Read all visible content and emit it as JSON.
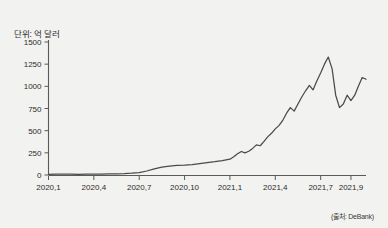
{
  "figure": {
    "unit_label": "단위: 억 달러",
    "source_label": "(출처: DeBank)",
    "background_color": "#f2f2f0",
    "line_color": "#4a4a4a",
    "axis_color": "#5a5a5a"
  },
  "chart_data": {
    "type": "line",
    "title": "",
    "subtitle": "",
    "xlabel": "",
    "ylabel": "단위: 억 달러",
    "ylim": [
      0,
      1500
    ],
    "yticks": [
      0,
      250,
      500,
      750,
      1000,
      1250,
      1500
    ],
    "ytick_labels": [
      "0",
      "250",
      "500",
      "750",
      "1000",
      "1250",
      "1500"
    ],
    "xtick_labels": [
      "2020,1",
      "2020,4",
      "2020,7",
      "2020,10",
      "2021,1",
      "2021,4",
      "2021,7",
      "2021,9"
    ],
    "xtick_values": [
      2020.0,
      2020.25,
      2020.5,
      2020.75,
      2021.0,
      2021.25,
      2021.5,
      2021.667
    ],
    "xlim": [
      2020.0,
      2021.75
    ],
    "grid": false,
    "legend": false,
    "annotations": [
      "(출처: DeBank)"
    ],
    "series": [
      {
        "name": "DeFi 예치금 (TVL)",
        "color": "#4a4a4a",
        "x": [
          2020.0,
          2020.042,
          2020.083,
          2020.125,
          2020.167,
          2020.208,
          2020.25,
          2020.292,
          2020.333,
          2020.375,
          2020.417,
          2020.458,
          2020.5,
          2020.542,
          2020.583,
          2020.625,
          2020.667,
          2020.708,
          2020.75,
          2020.792,
          2020.833,
          2020.875,
          2020.917,
          2020.958,
          2021.0,
          2021.021,
          2021.042,
          2021.063,
          2021.083,
          2021.104,
          2021.125,
          2021.146,
          2021.167,
          2021.188,
          2021.208,
          2021.229,
          2021.25,
          2021.271,
          2021.292,
          2021.313,
          2021.333,
          2021.354,
          2021.375,
          2021.396,
          2021.417,
          2021.438,
          2021.458,
          2021.479,
          2021.5,
          2021.521,
          2021.542,
          2021.563,
          2021.583,
          2021.604,
          2021.625,
          2021.646,
          2021.667,
          2021.688,
          2021.708,
          2021.729,
          2021.75
        ],
        "values": [
          8,
          9,
          10,
          9,
          8,
          9,
          10,
          11,
          12,
          14,
          16,
          20,
          26,
          45,
          70,
          90,
          100,
          108,
          112,
          118,
          128,
          140,
          150,
          162,
          178,
          205,
          240,
          265,
          250,
          268,
          300,
          340,
          330,
          380,
          430,
          470,
          520,
          560,
          620,
          700,
          760,
          720,
          800,
          880,
          950,
          1010,
          960,
          1060,
          1150,
          1250,
          1330,
          1200,
          900,
          760,
          800,
          900,
          840,
          900,
          1000,
          1100,
          1080
        ]
      }
    ],
    "peak": {
      "x": 2021.542,
      "value": 1330
    },
    "trough_after_peak": {
      "x": 2021.604,
      "value": 760
    },
    "final_value": 1080
  }
}
